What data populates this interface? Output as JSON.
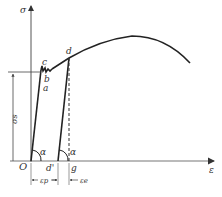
{
  "diagram": {
    "type": "stress-strain curve",
    "axes": {
      "y_label": "σ",
      "x_label": "ε",
      "origin_label": "O"
    },
    "points": {
      "a": "a",
      "b": "b",
      "c": "c",
      "d": "d",
      "d_prime": "d'",
      "g": "g"
    },
    "angles": {
      "left": "α",
      "right": "α"
    },
    "dimensions": {
      "yield_stress": "σs",
      "plastic_strain": "εp",
      "elastic_strain": "εe"
    },
    "colors": {
      "curve": "#222222",
      "axis": "#555555",
      "text": "#333333"
    }
  }
}
